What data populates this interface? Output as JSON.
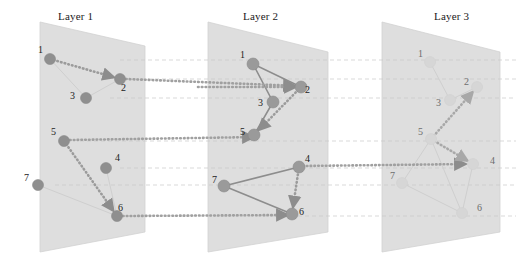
{
  "figure": {
    "type": "multilayer-network-diagram",
    "width": 516,
    "height": 269,
    "background": "#ffffff"
  },
  "colors": {
    "plane_fill": "#dedede",
    "plane_edge": "#d2d2d2",
    "node_strong": "#9a9a9a",
    "node_mid": "#8f8f8f",
    "node_faint": "#d6d6d6",
    "edge_strong": "#8d8d8d",
    "edge_faint": "#cfcfcf",
    "path_dotted": "#9b9b9b",
    "interlayer_dash": "#c9c9c9",
    "interlayer_dotted": "#a0a0a0",
    "label_color": "#222222"
  },
  "layers": [
    {
      "id": "layer-1",
      "title": "Layer 1",
      "title_x": 58,
      "title_y": 10,
      "plane": "40,22 145,46 145,232 40,252",
      "nodes": [
        {
          "id": "n1-1",
          "label": "1",
          "x": 50,
          "y": 59,
          "r": 5.5,
          "tone": "mid",
          "lx": 38,
          "ly": 44
        },
        {
          "id": "n1-2",
          "label": "2",
          "x": 120,
          "y": 79,
          "r": 5.5,
          "tone": "mid",
          "lx": 121,
          "ly": 82
        },
        {
          "id": "n1-3",
          "label": "3",
          "x": 86,
          "y": 98,
          "r": 5.5,
          "tone": "mid",
          "lx": 70,
          "ly": 90
        },
        {
          "id": "n1-4",
          "label": "4",
          "x": 106,
          "y": 168,
          "r": 5.5,
          "tone": "mid",
          "lx": 115,
          "ly": 152
        },
        {
          "id": "n1-5",
          "label": "5",
          "x": 64,
          "y": 141,
          "r": 5.5,
          "tone": "mid",
          "lx": 51,
          "ly": 126
        },
        {
          "id": "n1-6",
          "label": "6",
          "x": 117,
          "y": 216,
          "r": 5.5,
          "tone": "mid",
          "lx": 118,
          "ly": 202
        },
        {
          "id": "n1-7",
          "label": "7",
          "x": 38,
          "y": 185,
          "r": 5.5,
          "tone": "mid",
          "lx": 24,
          "ly": 172
        }
      ],
      "edges": [
        {
          "from": "n1-1",
          "to": "n1-3",
          "style": "faint"
        },
        {
          "from": "n1-3",
          "to": "n1-2",
          "style": "faint"
        },
        {
          "from": "n1-4",
          "to": "n1-6",
          "style": "faint"
        },
        {
          "from": "n1-7",
          "to": "n1-6",
          "style": "faint"
        }
      ],
      "path_edges": [
        {
          "from": "n1-1",
          "to": "n1-2",
          "arrow": true
        },
        {
          "from": "n1-5",
          "to": "n1-6",
          "arrow": true
        }
      ]
    },
    {
      "id": "layer-2",
      "title": "Layer 2",
      "title_x": 243,
      "title_y": 10,
      "plane": "208,22 328,52 328,232 208,252",
      "nodes": [
        {
          "id": "n2-1",
          "label": "1",
          "x": 253,
          "y": 64,
          "r": 6.0,
          "tone": "strong",
          "lx": 240,
          "ly": 49
        },
        {
          "id": "n2-2",
          "label": "2",
          "x": 301,
          "y": 87,
          "r": 6.0,
          "tone": "strong",
          "lx": 305,
          "ly": 84
        },
        {
          "id": "n2-3",
          "label": "3",
          "x": 273,
          "y": 102,
          "r": 6.0,
          "tone": "strong",
          "lx": 258,
          "ly": 97
        },
        {
          "id": "n2-4",
          "label": "4",
          "x": 299,
          "y": 167,
          "r": 6.0,
          "tone": "strong",
          "lx": 305,
          "ly": 153
        },
        {
          "id": "n2-5",
          "label": "5",
          "x": 254,
          "y": 135,
          "r": 6.0,
          "tone": "strong",
          "lx": 240,
          "ly": 126
        },
        {
          "id": "n2-6",
          "label": "6",
          "x": 292,
          "y": 214,
          "r": 6.0,
          "tone": "strong",
          "lx": 299,
          "ly": 206
        },
        {
          "id": "n2-7",
          "label": "7",
          "x": 224,
          "y": 186,
          "r": 6.0,
          "tone": "strong",
          "lx": 212,
          "ly": 174
        }
      ],
      "edges": [
        {
          "from": "n2-1",
          "to": "n2-3",
          "style": "strong"
        },
        {
          "from": "n2-1",
          "to": "n2-2",
          "style": "strong"
        },
        {
          "from": "n2-3",
          "to": "n2-5",
          "style": "strong"
        },
        {
          "from": "n2-7",
          "to": "n2-4",
          "style": "strong"
        },
        {
          "from": "n2-7",
          "to": "n2-6",
          "style": "strong"
        }
      ],
      "path_edges": [
        {
          "from": "n2-2",
          "to": "n2-5",
          "arrow": true
        },
        {
          "from": "n2-4",
          "to": "n2-6",
          "arrow": true
        }
      ]
    },
    {
      "id": "layer-3",
      "title": "Layer 3",
      "title_x": 434,
      "title_y": 10,
      "plane": "382,22 500,52 500,232 382,252"
    }
  ],
  "layer3_nodes": [
    {
      "id": "n3-1",
      "label": "1",
      "x": 430,
      "y": 62,
      "r": 5.5,
      "tone": "faint",
      "lx": 418,
      "ly": 48
    },
    {
      "id": "n3-2",
      "label": "2",
      "x": 477,
      "y": 87,
      "r": 5.5,
      "tone": "faint",
      "lx": 464,
      "ly": 76
    },
    {
      "id": "n3-3",
      "label": "3",
      "x": 450,
      "y": 100,
      "r": 5.5,
      "tone": "faint",
      "lx": 436,
      "ly": 97
    },
    {
      "id": "n3-4",
      "label": "4",
      "x": 473,
      "y": 164,
      "r": 5.5,
      "tone": "faint",
      "lx": 490,
      "ly": 155
    },
    {
      "id": "n3-5",
      "label": "5",
      "x": 431,
      "y": 139,
      "r": 5.5,
      "tone": "faint",
      "lx": 418,
      "ly": 126
    },
    {
      "id": "n3-6",
      "label": "6",
      "x": 462,
      "y": 213,
      "r": 5.5,
      "tone": "faint",
      "lx": 477,
      "ly": 202
    },
    {
      "id": "n3-7",
      "label": "7",
      "x": 402,
      "y": 183,
      "r": 5.5,
      "tone": "faint",
      "lx": 390,
      "ly": 170
    }
  ],
  "layer3_edges": [
    {
      "from": "n3-1",
      "to": "n3-3",
      "style": "faint"
    },
    {
      "from": "n3-3",
      "to": "n3-2",
      "style": "faint"
    },
    {
      "from": "n3-5",
      "to": "n3-7",
      "style": "faint"
    },
    {
      "from": "n3-5",
      "to": "n3-4",
      "style": "faint"
    },
    {
      "from": "n3-5",
      "to": "n3-6",
      "style": "faint"
    },
    {
      "from": "n3-7",
      "to": "n3-6",
      "style": "faint"
    },
    {
      "from": "n3-4",
      "to": "n3-6",
      "style": "faint"
    }
  ],
  "layer3_path_edges": [
    {
      "from": "n3-5",
      "to": "n3-2",
      "arrow": true
    },
    {
      "from": "n3-5",
      "to": "n3-4",
      "arrow": true
    }
  ],
  "interlayer_guides": [
    {
      "id": "g-1a",
      "x1": 120,
      "y1": 60,
      "x2": 516,
      "y2": 60
    },
    {
      "id": "g-1b",
      "x1": 120,
      "y1": 79,
      "x2": 516,
      "y2": 79
    },
    {
      "id": "g-1c",
      "x1": 110,
      "y1": 98,
      "x2": 516,
      "y2": 98
    },
    {
      "id": "g-1d",
      "x1": 80,
      "y1": 141,
      "x2": 516,
      "y2": 141
    },
    {
      "id": "g-1e",
      "x1": 120,
      "y1": 168,
      "x2": 516,
      "y2": 168
    },
    {
      "id": "g-1f",
      "x1": 55,
      "y1": 185,
      "x2": 516,
      "y2": 185
    },
    {
      "id": "g-1g",
      "x1": 130,
      "y1": 216,
      "x2": 516,
      "y2": 216
    }
  ],
  "interlayer_paths": [
    {
      "id": "p-1-2-top",
      "x1": 126,
      "y1": 79,
      "x2": 299,
      "y2": 86,
      "note": "layer1 node2 to layer2 node2"
    },
    {
      "id": "p-2-1-mid",
      "x1": 198,
      "y1": 87,
      "x2": 300,
      "y2": 87,
      "note": "guide into layer2 node2"
    },
    {
      "id": "p-1-5",
      "x1": 70,
      "y1": 140,
      "x2": 258,
      "y2": 137,
      "note": "layer1 node5 to layer2 node5"
    },
    {
      "id": "p-1-6",
      "x1": 123,
      "y1": 216,
      "x2": 292,
      "y2": 215,
      "note": "layer1 node6 to layer2 node6"
    },
    {
      "id": "p-2-3-4",
      "x1": 303,
      "y1": 166,
      "x2": 470,
      "y2": 164,
      "note": "layer2 node4 to layer3 node4"
    }
  ],
  "annotations": {
    "description": "Three stacked network layers (Layer 1, Layer 2, Layer 3) rendered as tilted parallelogram planes, each containing seven numbered nodes (1-7). Dotted arrow paths trace a route within and across layers; faint horizontal dashed lines align corresponding nodes between layers."
  }
}
